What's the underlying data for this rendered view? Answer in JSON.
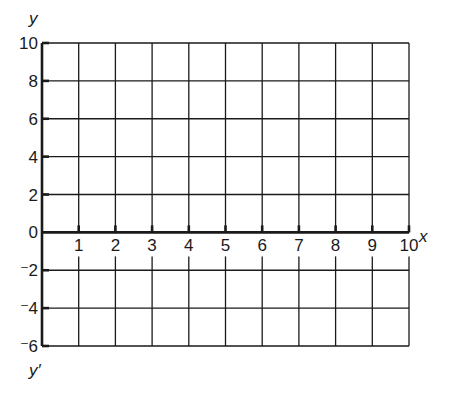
{
  "chart_data": {
    "type": "line",
    "title": "",
    "xlabel": "x",
    "ylabel": "y",
    "ylabel_negative": "y'",
    "xlim": [
      0,
      10
    ],
    "ylim": [
      -6,
      10
    ],
    "grid": true,
    "x_ticks": [
      1,
      2,
      3,
      4,
      5,
      6,
      7,
      8,
      9,
      10
    ],
    "x_tick_labels": [
      "1",
      "2",
      "3",
      "4",
      "5",
      "6",
      "7",
      "8",
      "9",
      "10"
    ],
    "y_ticks": [
      10,
      8,
      6,
      4,
      2,
      0,
      -2,
      -4,
      -6
    ],
    "y_tick_labels": [
      "10",
      "8",
      "6",
      "4",
      "2",
      "0",
      "⁻2",
      "⁻4",
      "⁻6"
    ],
    "series": [],
    "legend": null
  },
  "labels": {
    "x_axis_name": "x",
    "y_axis_name": "y",
    "y_negative_name": "y′"
  },
  "colors": {
    "line": "#1a1a1a",
    "background": "#ffffff"
  }
}
